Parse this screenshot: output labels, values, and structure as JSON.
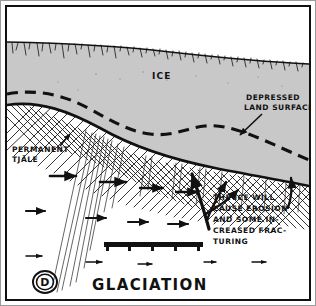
{
  "figure": {
    "title": "GLACIATION",
    "logo_letter": "D",
    "logo_name": "circled-d-monogram"
  },
  "labels": {
    "ice": "ICE",
    "depressed_land_surface": [
      "DEPRESSED",
      "LAND SURFACE"
    ],
    "permanent_tjale": [
      "PERMANENT",
      "TJÄLE"
    ],
    "erosion_note": [
      "THE ICE WILL",
      "CAUSE EROSION",
      "AND SOME IN-",
      "CREASED FRAC-",
      "TURING"
    ]
  },
  "colors": {
    "ice_fill": "#c8c8c8",
    "ink": "#111111",
    "paper": "#ffffff",
    "frame": "#9a9a9a"
  },
  "elements": {
    "ice_body_name": "ice-sheet-body",
    "bedrock_name": "bedrock-hatching",
    "land_surface_name": "land-surface-line",
    "depressed_line_name": "depressed-surface-dashed-line",
    "scale_bar_name": "scale-bar",
    "flow_arrows_name": "subsurface-flow-arrows",
    "fracture_lines_name": "fracture-lines"
  }
}
